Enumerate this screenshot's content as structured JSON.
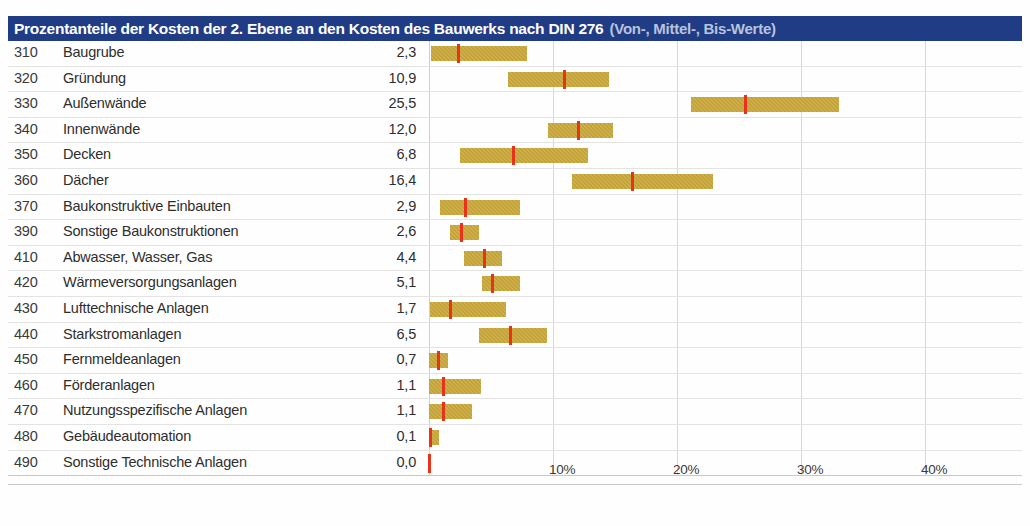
{
  "header": {
    "title_main": "Prozentanteile der Kosten der 2. Ebene an den Kosten des Bauwerks nach DIN 276",
    "title_sub": "(Von-, Mittel-, Bis-Werte)",
    "bg_color": "#1f3c84",
    "title_color": "#ffffff",
    "subtitle_color": "#b9c3dd"
  },
  "colors": {
    "bar_fill": "#c4a130",
    "mid_marker": "#e8331b",
    "grid": "#d8d8d8",
    "row_rule": "#e3e3e3"
  },
  "chart_data": {
    "type": "bar",
    "title": "Prozentanteile der Kosten der 2. Ebene an den Kosten des Bauwerks nach DIN 276 (Von-, Mittel-, Bis-Werte)",
    "xlabel": "",
    "ylabel": "",
    "xlim": [
      0,
      44
    ],
    "grid": true,
    "legend": "none",
    "orientation": "horizontal-range",
    "axis_ticks": [
      {
        "label": "10%",
        "value": 10
      },
      {
        "label": "20%",
        "value": 20
      },
      {
        "label": "30%",
        "value": 30
      },
      {
        "label": "40%",
        "value": 40
      }
    ],
    "columns": [
      "Kostengruppe",
      "Bezeichnung",
      "Mittelwert %"
    ],
    "categories": [
      "Baugrube",
      "Gründung",
      "Außenwände",
      "Innenwände",
      "Decken",
      "Dächer",
      "Baukonstruktive Einbauten",
      "Sonstige Baukonstruktionen",
      "Abwasser, Wasser, Gas",
      "Wärmeversorgungsanlagen",
      "Lufttechnische Anlagen",
      "Starkstromanlagen",
      "Fernmeldeanlagen",
      "Förderanlagen",
      "Nutzungsspezifische Anlagen",
      "Gebäudeautomation",
      "Sonstige Technische Anlagen"
    ],
    "values": [
      2.3,
      10.9,
      25.5,
      12.0,
      6.8,
      16.4,
      2.9,
      2.6,
      4.4,
      5.1,
      1.7,
      6.5,
      0.7,
      1.1,
      1.1,
      0.1,
      0.0
    ],
    "rows": [
      {
        "code": "310",
        "label": "Baugrube",
        "value_text": "2,3",
        "von": 0.2,
        "mittel": 2.3,
        "bis": 7.9
      },
      {
        "code": "320",
        "label": "Gründung",
        "value_text": "10,9",
        "von": 6.4,
        "mittel": 10.9,
        "bis": 14.5
      },
      {
        "code": "330",
        "label": "Außenwände",
        "value_text": "25,5",
        "von": 21.1,
        "mittel": 25.5,
        "bis": 33.1
      },
      {
        "code": "340",
        "label": "Innenwände",
        "value_text": "12,0",
        "von": 9.6,
        "mittel": 12.0,
        "bis": 14.8
      },
      {
        "code": "350",
        "label": "Decken",
        "value_text": "6,8",
        "von": 2.5,
        "mittel": 6.8,
        "bis": 12.8
      },
      {
        "code": "360",
        "label": "Dächer",
        "value_text": "16,4",
        "von": 11.5,
        "mittel": 16.4,
        "bis": 22.9
      },
      {
        "code": "370",
        "label": "Baukonstruktive Einbauten",
        "value_text": "2,9",
        "von": 0.9,
        "mittel": 2.9,
        "bis": 7.3
      },
      {
        "code": "390",
        "label": "Sonstige Baukonstruktionen",
        "value_text": "2,6",
        "von": 1.7,
        "mittel": 2.6,
        "bis": 4.0
      },
      {
        "code": "410",
        "label": "Abwasser, Wasser, Gas",
        "value_text": "4,4",
        "von": 2.8,
        "mittel": 4.4,
        "bis": 5.9
      },
      {
        "code": "420",
        "label": "Wärmeversorgungsanlagen",
        "value_text": "5,1",
        "von": 4.3,
        "mittel": 5.1,
        "bis": 7.3
      },
      {
        "code": "430",
        "label": "Lufttechnische Anlagen",
        "value_text": "1,7",
        "von": 0.1,
        "mittel": 1.7,
        "bis": 6.2
      },
      {
        "code": "440",
        "label": "Starkstromanlagen",
        "value_text": "6,5",
        "von": 4.0,
        "mittel": 6.5,
        "bis": 9.5
      },
      {
        "code": "450",
        "label": "Fernmeldeanlagen",
        "value_text": "0,7",
        "von": 0.0,
        "mittel": 0.7,
        "bis": 1.5
      },
      {
        "code": "460",
        "label": "Förderanlagen",
        "value_text": "1,1",
        "von": 0.0,
        "mittel": 1.1,
        "bis": 4.2
      },
      {
        "code": "470",
        "label": "Nutzungsspezifische Anlagen",
        "value_text": "1,1",
        "von": 0.0,
        "mittel": 1.1,
        "bis": 3.5
      },
      {
        "code": "480",
        "label": "Gebäudeautomation",
        "value_text": "0,1",
        "von": 0.0,
        "mittel": 0.1,
        "bis": 0.8
      },
      {
        "code": "490",
        "label": "Sonstige Technische Anlagen",
        "value_text": "0,0",
        "von": 0.0,
        "mittel": 0.0,
        "bis": 0.0
      }
    ]
  }
}
